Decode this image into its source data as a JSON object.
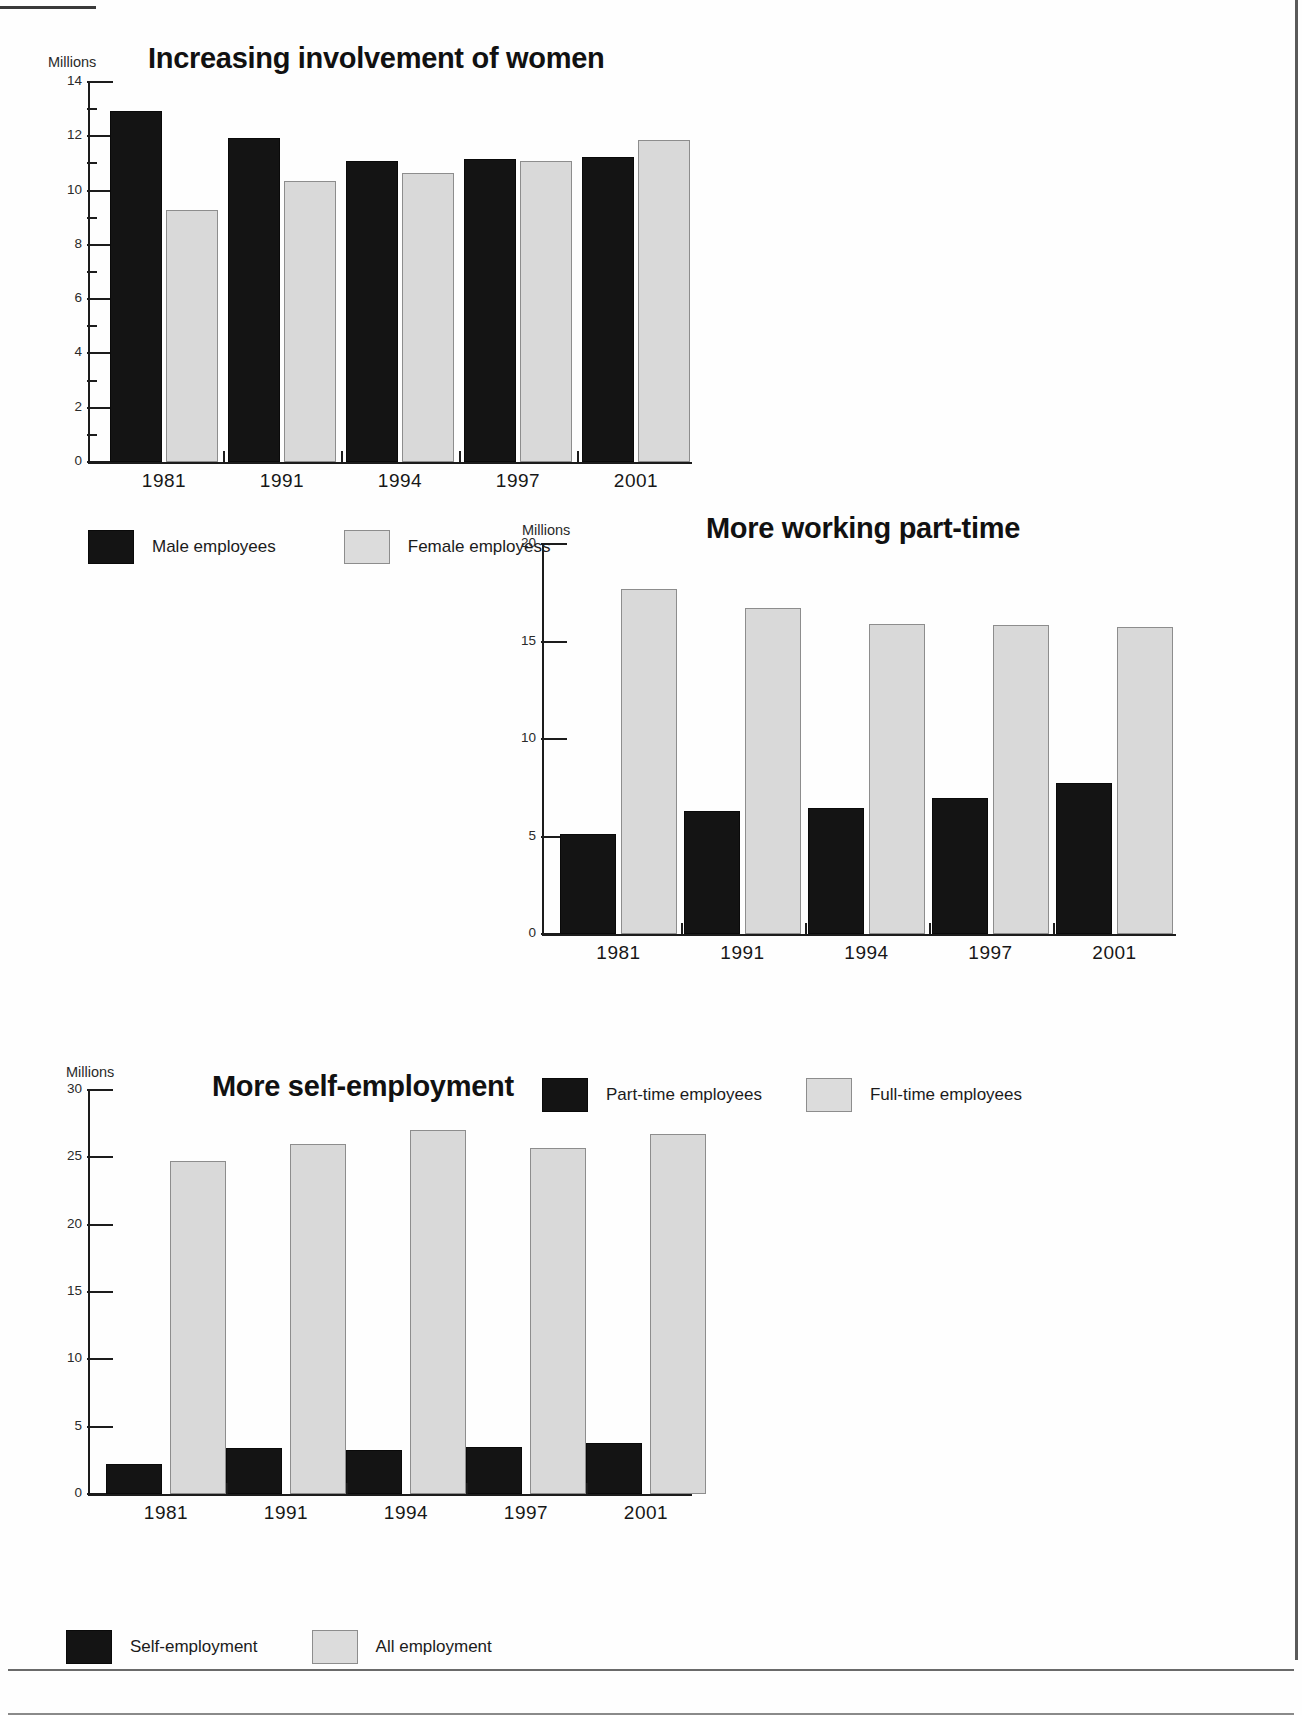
{
  "charts": [
    {
      "id": "increasing-involvement-of-women",
      "title": "Increasing involvement of women",
      "unit_label": "Millions",
      "legend": [
        {
          "label": "Male employees",
          "swatch": "dark"
        },
        {
          "label": "Female employess",
          "swatch": "light"
        }
      ],
      "chart_data": {
        "type": "bar",
        "title": "Increasing involvement of women",
        "xlabel": "",
        "ylabel": "Millions",
        "ylim": [
          0,
          14
        ],
        "yticks": [
          0,
          2,
          4,
          6,
          8,
          10,
          12,
          14
        ],
        "ytick_labels": [
          "0",
          "2",
          "4",
          "6",
          "8",
          "10",
          "12",
          "14"
        ],
        "grid": false,
        "legend_position": "below",
        "categories": [
          "1981",
          "1991",
          "1994",
          "1997",
          "2001"
        ],
        "series": [
          {
            "name": "Male employees",
            "color": "#141414",
            "values": [
              12.95,
              11.95,
              11.1,
              11.15,
              11.25
            ]
          },
          {
            "name": "Female employess",
            "color": "#d9d9d9",
            "values": [
              9.3,
              10.35,
              10.65,
              11.1,
              11.85
            ]
          }
        ]
      }
    },
    {
      "id": "more-working-part-time",
      "title": "More working part-time",
      "unit_label": "Millions",
      "legend": [
        {
          "label": "Part-time employees",
          "swatch": "dark"
        },
        {
          "label": "Full-time employees",
          "swatch": "light"
        }
      ],
      "chart_data": {
        "type": "bar",
        "title": "More working part-time",
        "xlabel": "",
        "ylabel": "Millions",
        "ylim": [
          0,
          20
        ],
        "yticks": [
          0,
          5,
          10,
          15,
          20
        ],
        "ytick_labels": [
          "0",
          "5",
          "10",
          "15",
          "20"
        ],
        "grid": false,
        "legend_position": "below",
        "categories": [
          "1981",
          "1991",
          "1994",
          "1997",
          "2001"
        ],
        "series": [
          {
            "name": "Part-time employees",
            "color": "#141414",
            "values": [
              5.15,
              6.3,
              6.45,
              6.95,
              7.75
            ]
          },
          {
            "name": "Full-time employees",
            "color": "#d9d9d9",
            "values": [
              17.7,
              16.7,
              15.9,
              15.85,
              15.75
            ]
          }
        ]
      }
    },
    {
      "id": "more-self-employment",
      "title": "More self-employment",
      "unit_label": "Millions",
      "legend": [
        {
          "label": "Self-employment",
          "swatch": "dark"
        },
        {
          "label": "All employment",
          "swatch": "light"
        }
      ],
      "chart_data": {
        "type": "bar",
        "title": "More self-employment",
        "xlabel": "",
        "ylabel": "Millions",
        "ylim": [
          0,
          30
        ],
        "yticks": [
          0,
          5,
          10,
          15,
          20,
          25,
          30
        ],
        "ytick_labels": [
          "0",
          "5",
          "10",
          "15",
          "20",
          "25",
          "30"
        ],
        "grid": false,
        "legend_position": "below",
        "categories": [
          "1981",
          "1991",
          "1994",
          "1997",
          "2001"
        ],
        "series": [
          {
            "name": "Self-employment",
            "color": "#141414",
            "values": [
              2.2,
              3.4,
              3.3,
              3.5,
              3.8
            ]
          },
          {
            "name": "All employment",
            "color": "#d9d9d9",
            "values": [
              24.7,
              26.0,
              27.0,
              25.7,
              26.7
            ]
          }
        ]
      }
    }
  ]
}
